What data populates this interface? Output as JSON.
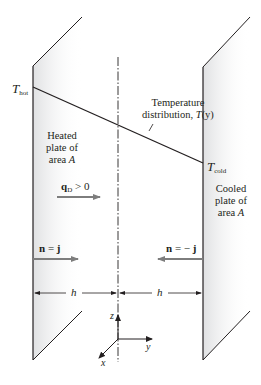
{
  "figure": {
    "labels": {
      "t_hot": {
        "main": "T",
        "sub": "hot"
      },
      "t_cold": {
        "main": "T",
        "sub": "cold"
      },
      "temperature_distribution": {
        "line1": "Temperature",
        "line2": "distribution, ",
        "func": "T",
        "arg": "(y)"
      },
      "heated_plate": {
        "line1": "Heated",
        "line2": "plate of",
        "line3": "area ",
        "var": "A"
      },
      "cooled_plate": {
        "line1": "Cooled",
        "line2": "plate of",
        "line3": "area ",
        "var": "A"
      },
      "heat_flux": {
        "vec": "q",
        "sub": "D",
        "rel": " > 0"
      },
      "normal_left": {
        "lhs": "n",
        "eq": " = ",
        "rhs": "j"
      },
      "normal_right": {
        "lhs": "n",
        "eq": " = − ",
        "rhs": "j"
      },
      "gap_left": "h",
      "gap_right": "h",
      "axis_z": "z",
      "axis_y": "y",
      "axis_x": "x"
    },
    "colors": {
      "line": "#231f20",
      "arrow_gray": "#7d7d7d",
      "plate_shade": "#e6e7e8"
    }
  }
}
